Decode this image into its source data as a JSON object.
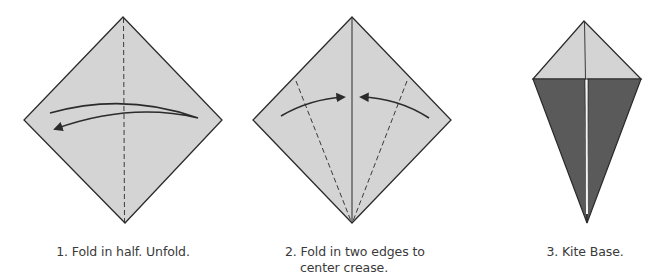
{
  "colors": {
    "paper_light": "#d4d4d4",
    "paper_dark": "#5a5a5a",
    "outline": "#2b2b2b",
    "crease_gap": "#f4f4f4",
    "text": "#3a3a3a"
  },
  "steps": [
    {
      "number": "1",
      "caption": "1. Fold in half. Unfold.",
      "figure": "square-diamond-with-vertical-dashed-crease-and-curved-arrow",
      "icons": [
        "fold-unfold-arrow-icon"
      ]
    },
    {
      "number": "2",
      "caption_line1": "2. Fold in two edges to",
      "caption_line2": "center crease.",
      "figure": "square-diamond-with-center-crease-two-dashed-fold-lines-and-two-arrows",
      "icons": [
        "fold-left-edge-arrow-icon",
        "fold-right-edge-arrow-icon"
      ]
    },
    {
      "number": "3",
      "caption": "3. Kite Base.",
      "figure": "kite-base-shape"
    }
  ]
}
